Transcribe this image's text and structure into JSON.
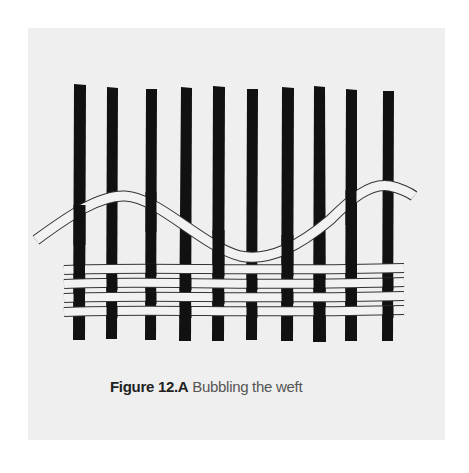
{
  "figure": {
    "label": "Figure 12.A",
    "title": "Bubbling the weft",
    "warp_count": 10,
    "weft_rows_woven": 4,
    "bubbled_weft_rows": 1
  },
  "colors": {
    "background": "#ffffff",
    "panel": "#efefef",
    "warp": "#111111",
    "weft_fill": "#f2f2f2",
    "weft_outline": "#333333"
  }
}
